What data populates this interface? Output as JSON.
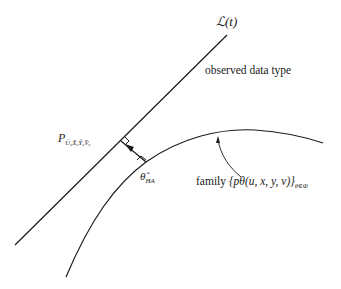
{
  "diagram": {
    "line_label": "ℒ(t)",
    "line_caption": "observed data type",
    "projection_point": {
      "symbol": "P",
      "subscript": "Ü₀X̂₀Ŷ₀V̂₀"
    },
    "estimate_point": {
      "symbol": "θ̂",
      "subscript": "HA"
    },
    "family_label": {
      "prefix": "family ",
      "expression": "{pθ(u, x, y, v)}",
      "subscript": "θ∈Φ"
    },
    "elements": {
      "straight_line": "L(t) line from lower-left to upper-right",
      "curve": "model family curve",
      "projection_arrow": "arrow from curve point to line, with right-angle markers at both ends",
      "pointer_arrow": "curved arrow from family label pointing to curve"
    }
  }
}
